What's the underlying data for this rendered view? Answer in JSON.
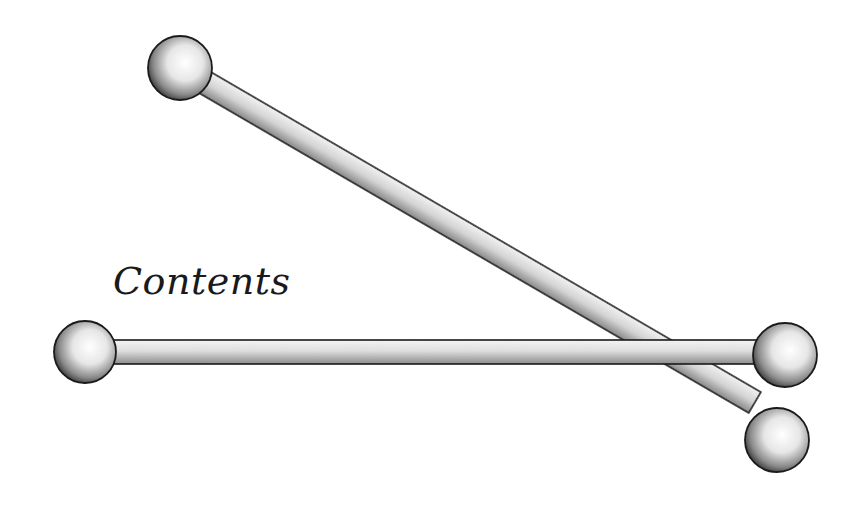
{
  "page": {
    "heading": "Contents"
  },
  "illustration": {
    "subject": "two-crossed-dumbbell-rods",
    "style": "stippled-pen-drawing",
    "ink_color": "#111111",
    "paper_color": "#ffffff"
  }
}
